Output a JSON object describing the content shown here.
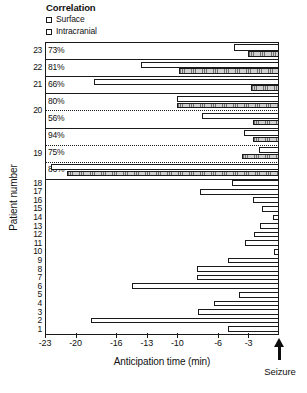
{
  "legend": {
    "title": "Correlation",
    "items": [
      {
        "label": "Surface",
        "swatch": "surface-swatch-icon"
      },
      {
        "label": "Intracranial",
        "swatch": "intracranial-swatch-icon"
      }
    ]
  },
  "axes": {
    "y_title": "Patient number",
    "x_title": "Anticipation time (min)",
    "x_ticks": [
      "-23",
      "-20",
      "-16",
      "-13",
      "-10",
      "-6",
      "-3"
    ],
    "seizure_label": "Seizure",
    "seizure_marker": "up-arrow-icon"
  },
  "chart_data": {
    "type": "bar",
    "orientation": "horizontal",
    "title": "",
    "xlabel": "Anticipation time (min)",
    "ylabel": "Patient number",
    "xlim": [
      -23,
      0
    ],
    "xticks": [
      -23,
      -20,
      -16,
      -13,
      -10,
      -6,
      -3
    ],
    "grid": false,
    "legend_position": "top-left",
    "legend_title": "Correlation",
    "series": [
      {
        "name": "Surface",
        "fill": "white"
      },
      {
        "name": "Intracranial",
        "fill": "hatched-gray"
      }
    ],
    "annotations": [
      {
        "text": "Seizure",
        "x": 0,
        "type": "arrow-up"
      }
    ],
    "groups": [
      {
        "patient": "23",
        "seizures": [
          {
            "correlation": "73%",
            "surface_start": -4.4,
            "intracranial_start": -3.0,
            "end": 0
          }
        ]
      },
      {
        "patient": "22",
        "seizures": [
          {
            "correlation": "81%",
            "surface_start": -13.6,
            "intracranial_start": -9.8,
            "end": 0
          }
        ]
      },
      {
        "patient": "21",
        "seizures": [
          {
            "correlation": "66%",
            "surface_start": -18.2,
            "intracranial_start": -2.8,
            "end": 0
          }
        ]
      },
      {
        "patient": "20",
        "seizures": [
          {
            "correlation": "80%",
            "surface_start": -10.0,
            "intracranial_start": -10.0,
            "end": 0
          },
          {
            "correlation": "56%",
            "surface_start": -7.6,
            "intracranial_start": -2.6,
            "end": 0
          }
        ]
      },
      {
        "patient": "19",
        "seizures": [
          {
            "correlation": "94%",
            "surface_start": -3.4,
            "intracranial_start": -2.6,
            "end": 0
          },
          {
            "correlation": "75%",
            "surface_start": -2.0,
            "intracranial_start": -3.6,
            "end": 0
          },
          {
            "correlation": "86%",
            "surface_start": -22.4,
            "intracranial_start": -20.8,
            "end": 0
          }
        ]
      },
      {
        "patient": "18",
        "seizures": [
          {
            "surface_start": -4.6,
            "end": 0
          }
        ]
      },
      {
        "patient": "17",
        "seizures": [
          {
            "surface_start": -7.8,
            "end": 0
          }
        ]
      },
      {
        "patient": "16",
        "seizures": [
          {
            "surface_start": -2.6,
            "end": 0
          }
        ]
      },
      {
        "patient": "15",
        "seizures": [
          {
            "surface_start": -1.7,
            "end": 0
          }
        ]
      },
      {
        "patient": "14",
        "seizures": [
          {
            "surface_start": -0.6,
            "end": 0
          }
        ]
      },
      {
        "patient": "13",
        "seizures": [
          {
            "surface_start": -1.9,
            "end": 0
          }
        ]
      },
      {
        "patient": "12",
        "seizures": [
          {
            "surface_start": -2.5,
            "end": 0
          }
        ]
      },
      {
        "patient": "11",
        "seizures": [
          {
            "surface_start": -3.3,
            "end": 0
          }
        ]
      },
      {
        "patient": "10",
        "seizures": [
          {
            "surface_start": -0.5,
            "end": 0
          }
        ]
      },
      {
        "patient": "9",
        "seizures": [
          {
            "surface_start": -5.0,
            "end": 0
          }
        ]
      },
      {
        "patient": "8",
        "seizures": [
          {
            "surface_start": -8.1,
            "end": 0
          }
        ]
      },
      {
        "patient": "7",
        "seizures": [
          {
            "surface_start": -8.1,
            "end": 0
          }
        ]
      },
      {
        "patient": "6",
        "seizures": [
          {
            "surface_start": -14.4,
            "end": 0
          }
        ]
      },
      {
        "patient": "5",
        "seizures": [
          {
            "surface_start": -3.9,
            "end": 0
          }
        ]
      },
      {
        "patient": "4",
        "seizures": [
          {
            "surface_start": -6.4,
            "end": 0
          }
        ]
      },
      {
        "patient": "3",
        "seizures": [
          {
            "surface_start": -8.0,
            "end": 0
          }
        ]
      },
      {
        "patient": "2",
        "seizures": [
          {
            "surface_start": -18.5,
            "end": 0
          }
        ]
      },
      {
        "patient": "1",
        "seizures": [
          {
            "surface_start": -5.0,
            "end": 0
          }
        ]
      }
    ]
  }
}
